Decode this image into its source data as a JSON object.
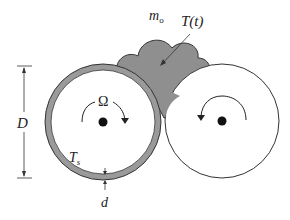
{
  "diagram": {
    "labels": {
      "mass": "m",
      "mass_sub": "o",
      "temperature": "T(t)",
      "omega": "Ω",
      "diameter": "D",
      "surface_temp": "T",
      "surface_temp_sub": "s",
      "thickness": "d"
    },
    "colors": {
      "shell_fill": "#9a9a9a",
      "blob_fill": "#8f8f8f",
      "stroke": "#333333",
      "background": "#ffffff"
    }
  }
}
